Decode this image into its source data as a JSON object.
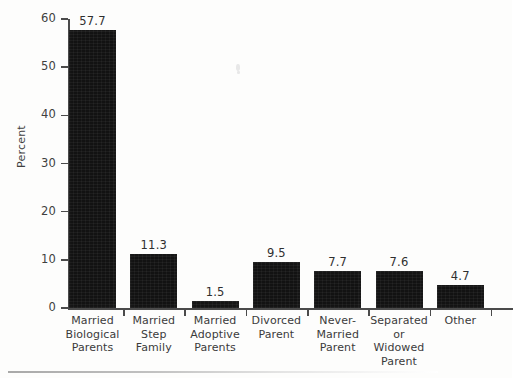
{
  "chart_data": {
    "type": "bar",
    "title": "",
    "xlabel": "",
    "ylabel": "Percent",
    "ylim": [
      0,
      60
    ],
    "yticks": [
      0,
      10,
      20,
      30,
      40,
      50,
      60
    ],
    "ytick_labels": [
      "0",
      "10",
      "20",
      "30",
      "40",
      "50",
      "60"
    ],
    "grid": false,
    "legend": false,
    "bar_color": "#121212",
    "categories": [
      "Married Biological Parents",
      "Married Step Family",
      "Married Adoptive Parents",
      "Divorced Parent",
      "Never-Married Parent",
      "Separated or Widowed Parent",
      "Other"
    ],
    "category_lines": [
      [
        "Married",
        "Biological",
        "Parents"
      ],
      [
        "Married",
        "Step",
        "Family"
      ],
      [
        "Married",
        "Adoptive",
        "Parents"
      ],
      [
        "Divorced",
        "Parent"
      ],
      [
        "Never-",
        "Married",
        "Parent"
      ],
      [
        "Separated",
        "or",
        "Widowed",
        "Parent"
      ],
      [
        "Other"
      ]
    ],
    "values": [
      57.7,
      11.3,
      1.5,
      9.5,
      7.7,
      7.6,
      4.7
    ],
    "value_labels": [
      "57.7",
      "11.3",
      "1.5",
      "9.5",
      "7.7",
      "7.6",
      "4.7"
    ]
  }
}
